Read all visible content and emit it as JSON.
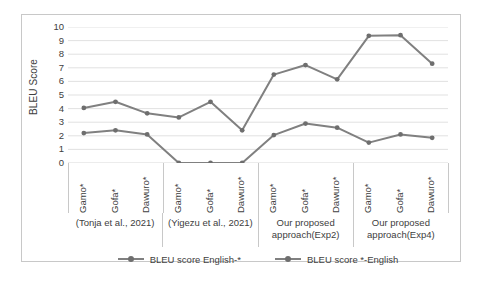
{
  "chart_data": {
    "type": "line",
    "title": "",
    "xlabel": "",
    "ylabel": "BLEU Score",
    "ylim": [
      0,
      10
    ],
    "ytick_labels": [
      "10",
      "9",
      "8",
      "7",
      "6",
      "5",
      "4",
      "3",
      "2",
      "1",
      "0"
    ],
    "grid": true,
    "legend_position": "bottom",
    "categories": [
      "Gamo*",
      "Gofa*",
      "Dawuro*",
      "Gamo*",
      "Gofa*",
      "Dawuro*",
      "Gamo*",
      "Gofa*",
      "Dawuro*",
      "Gamo*",
      "Gofa*",
      "Dawuro*"
    ],
    "groups": [
      {
        "label": "(Tonja et al., 2021)",
        "categories": [
          "Gamo*",
          "Gofa*",
          "Dawuro*"
        ]
      },
      {
        "label": "(Yigezu et al., 2021)",
        "categories": [
          "Gamo*",
          "Gofa*",
          "Dawuro*"
        ]
      },
      {
        "label": "Our proposed approach(Exp2)",
        "categories": [
          "Gamo*",
          "Gofa*",
          "Dawuro*"
        ]
      },
      {
        "label": "Our proposed approach(Exp4)",
        "categories": [
          "Gamo*",
          "Gofa*",
          "Dawuro*"
        ]
      }
    ],
    "series": [
      {
        "name": "BLEU score English-*",
        "color": "#808080",
        "values": [
          2.2,
          2.4,
          2.1,
          0.0,
          0.0,
          0.0,
          2.05,
          2.9,
          2.6,
          1.5,
          2.1,
          1.85
        ]
      },
      {
        "name": "BLEU score *-English",
        "color": "#808080",
        "values": [
          4.05,
          4.5,
          3.65,
          3.35,
          4.5,
          2.4,
          6.5,
          7.2,
          6.15,
          9.35,
          9.4,
          7.3
        ]
      }
    ]
  },
  "legend": {
    "items": [
      {
        "label": "BLEU score English-*"
      },
      {
        "label": "BLEU score *-English"
      }
    ]
  },
  "axis": {
    "y_title": "BLEU Score"
  },
  "colors": {
    "line": "#808080",
    "marker": "#6e6e6e",
    "grid": "#d9d9d9",
    "border": "#c8c8c8",
    "text": "#404040"
  }
}
